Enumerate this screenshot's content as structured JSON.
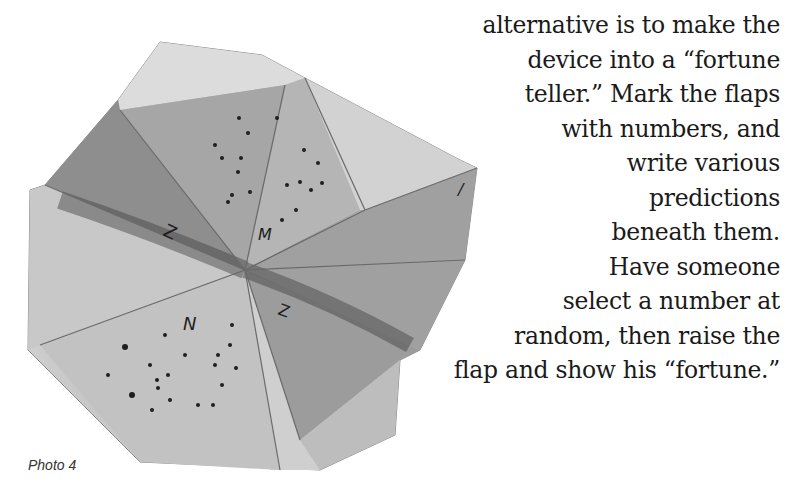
{
  "figure": {
    "caption": "Photo 4",
    "flap_marks": [
      "1",
      "2",
      "2",
      "N"
    ]
  },
  "text": {
    "lines": [
      "alternative is to make the",
      "device into a “fortune",
      "teller.” Mark the flaps",
      "with numbers, and",
      "write various",
      "predictions",
      "beneath them.",
      "Have someone",
      "select a number at",
      "random, then raise the",
      "flap and show his “fortune.”"
    ]
  },
  "colors": {
    "background": "#ffffff",
    "text": "#1a1a1a",
    "paper_light": "#d8d8d8",
    "paper_mid": "#a9a9a9",
    "paper_dark": "#6e6e6e"
  }
}
